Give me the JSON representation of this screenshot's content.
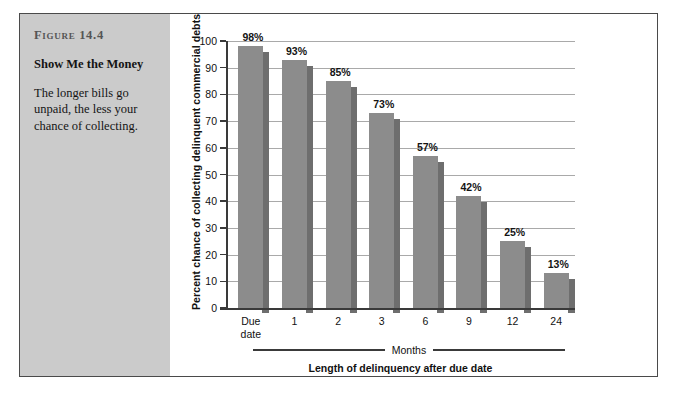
{
  "figure": {
    "number": "Figure 14.4",
    "title": "Show Me the Money",
    "description": "The longer bills go unpaid, the less your chance of collecting."
  },
  "chart_data": {
    "type": "bar",
    "title": "Show Me the Money",
    "categories": [
      "Due\ndate",
      "1",
      "2",
      "3",
      "6",
      "9",
      "12",
      "24"
    ],
    "values": [
      98,
      93,
      85,
      73,
      57,
      42,
      25,
      13
    ],
    "data_labels": [
      "98%",
      "93%",
      "85%",
      "73%",
      "57%",
      "42%",
      "25%",
      "13%"
    ],
    "xlabel": "Length of delinquency after due date",
    "ylabel": "Percent chance of collecting delinquent commercial debts",
    "group_label": "Months",
    "ylim": [
      0,
      100
    ],
    "yticks": [
      0,
      10,
      20,
      30,
      40,
      50,
      60,
      70,
      80,
      90,
      100
    ],
    "ytick_labels": [
      "0",
      "10",
      "20",
      "30",
      "40",
      "50",
      "60",
      "70",
      "80",
      "90",
      "100"
    ],
    "grid": true,
    "legend": null,
    "bar_color": "#8c8c8c",
    "bar_shadow_color": "#6e6e6e",
    "gridline_color": "#a9a9a9",
    "axis_color": "#3a3a3a",
    "panel_color": "#cbcbcb"
  }
}
